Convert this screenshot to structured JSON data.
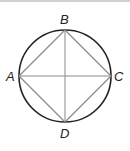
{
  "diagram": {
    "type": "inscribed-square-in-circle",
    "points": [
      {
        "id": "A",
        "label": "A"
      },
      {
        "id": "B",
        "label": "B"
      },
      {
        "id": "C",
        "label": "C"
      },
      {
        "id": "D",
        "label": "D"
      }
    ],
    "segments": [
      "AB",
      "BC",
      "CD",
      "DA",
      "AC",
      "BD"
    ],
    "colors": {
      "circle": "#222222",
      "segment": "#8a8a8a",
      "label": "#222222"
    }
  }
}
